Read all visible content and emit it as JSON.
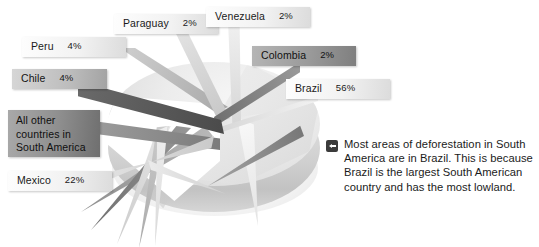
{
  "chart_data": {
    "type": "pie",
    "title": "",
    "subtitle": "",
    "xlabel": "",
    "ylabel": "",
    "legend_position": "callout-labels",
    "grid": false,
    "units": "percent",
    "categories": [
      "Brazil",
      "Mexico",
      "Peru",
      "Chile",
      "Paraguay",
      "Venezuela",
      "Colombia",
      "All other countries in South America"
    ],
    "values": [
      56,
      22,
      4,
      4,
      2,
      2,
      2,
      8
    ],
    "labels": [
      {
        "name": "Peru",
        "percent": "4%",
        "tone": "light"
      },
      {
        "name": "Paraguay",
        "percent": "2%",
        "tone": "light"
      },
      {
        "name": "Venezuela",
        "percent": "2%",
        "tone": "light"
      },
      {
        "name": "Colombia",
        "percent": "2%",
        "tone": "dark"
      },
      {
        "name": "Brazil",
        "percent": "56%",
        "tone": "light"
      },
      {
        "name": "Chile",
        "percent": "4%",
        "tone": "mid"
      },
      {
        "name": "All other countries in South America",
        "percent": "",
        "tone": "darker"
      },
      {
        "name": "Mexico",
        "percent": "22%",
        "tone": "light"
      }
    ]
  },
  "caption": {
    "icon": "left-arrow-icon",
    "text": "Most areas of deforestation in South America are in Brazil. This is because Brazil is the largest South American country and has the most lowland."
  },
  "colors": {
    "background": "#ffffff",
    "text": "#1b1b1b",
    "icon_fill": "#3b3b3b",
    "pie_light": "#ececec",
    "pie_mid": "#bdbdbd",
    "pie_dark": "#7f7f7f"
  }
}
